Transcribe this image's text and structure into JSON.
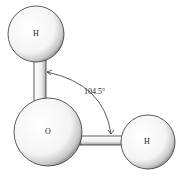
{
  "diagram": {
    "atoms": [
      {
        "id": "h_top",
        "label": "H",
        "cx": 36,
        "cy": 34,
        "r": 28
      },
      {
        "id": "o",
        "label": "O",
        "cx": 48,
        "cy": 132,
        "r": 34
      },
      {
        "id": "h_right",
        "label": "H",
        "cx": 148,
        "cy": 142,
        "r": 27
      }
    ],
    "bond_angle_label": "104.5°",
    "colors": {
      "stroke": "#333333",
      "fill": "#ffffff",
      "shade": "#9a9a9a"
    }
  }
}
